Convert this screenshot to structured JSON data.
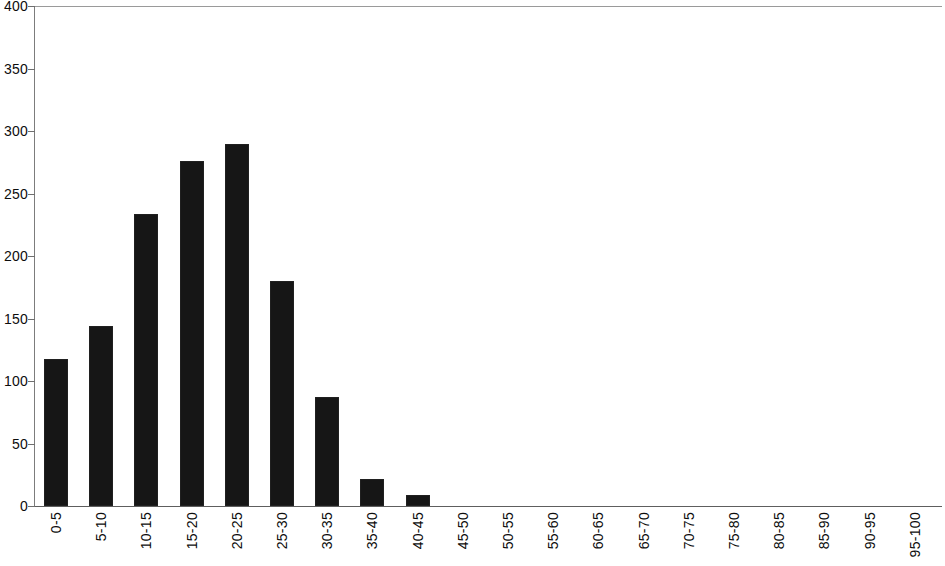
{
  "chart_data": {
    "type": "bar",
    "title": "",
    "subtitle": "",
    "xlabel": "",
    "ylabel": "",
    "ylim": [
      0,
      400
    ],
    "yticks": [
      0,
      50,
      100,
      150,
      200,
      250,
      300,
      350,
      400
    ],
    "ytick_labels": [
      "0",
      "50",
      "100",
      "150",
      "200",
      "250",
      "300",
      "350",
      "400"
    ],
    "grid": false,
    "legend": null,
    "bar_color": "#161616",
    "axis_color": "#6e6e6e",
    "background": "#ffffff",
    "categories": [
      "0-5",
      "5-10",
      "10-15",
      "15-20",
      "20-25",
      "25-30",
      "30-35",
      "35-40",
      "40-45",
      "45-50",
      "50-55",
      "55-60",
      "60-65",
      "65-70",
      "70-75",
      "75-80",
      "80-85",
      "85-90",
      "90-95",
      "95-100"
    ],
    "values": [
      118,
      144,
      234,
      276,
      290,
      180,
      87,
      22,
      9,
      0,
      0,
      0,
      0,
      0,
      0,
      0,
      0,
      0,
      0,
      0
    ]
  }
}
